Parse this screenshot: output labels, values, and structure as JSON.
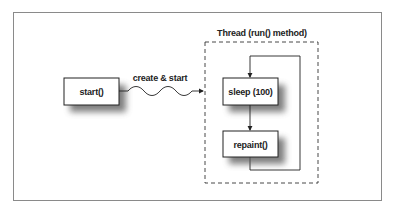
{
  "diagram": {
    "main_box": {
      "label": "start()"
    },
    "edge": {
      "label": "create & start",
      "style": "wavy-arrow"
    },
    "thread_group": {
      "label": "Thread (run() method)",
      "style": "dashed"
    },
    "loop_boxes": [
      {
        "label": "sleep (100)"
      },
      {
        "label": "repaint()"
      }
    ],
    "colors": {
      "stroke": "#222222",
      "frame": "#8a8a8a",
      "shadow": "#555555"
    }
  }
}
